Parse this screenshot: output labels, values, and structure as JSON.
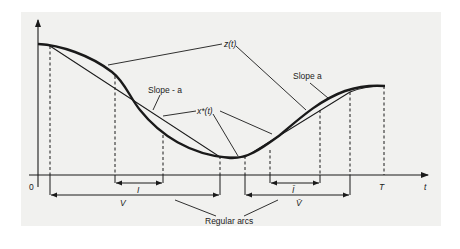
{
  "figure": {
    "type": "diagram",
    "labels": {
      "z_curve": "z(t)",
      "x_star": "x*(t)",
      "slope_neg": "Slope - a",
      "slope_pos": "Slope a",
      "origin": "0",
      "horizon": "T",
      "t_axis": "t",
      "interval_I_left": "I",
      "interval_I_right": "Ī",
      "interval_V_left": "V",
      "interval_V_right": "V̄",
      "regular_arcs": "Regular arcs"
    },
    "colors": {
      "ink": "#1a1a1a",
      "paper": "#f1f1ef",
      "background": "#ffffff"
    }
  }
}
